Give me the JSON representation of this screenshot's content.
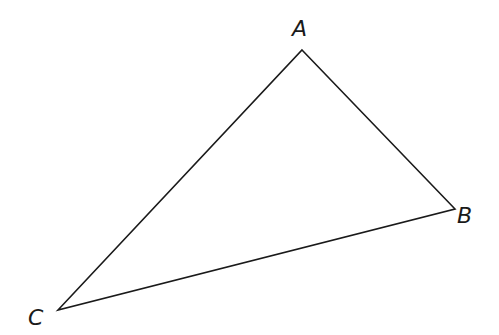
{
  "diagram": {
    "type": "triangle",
    "stroke_color": "#1a1a1a",
    "vertices": [
      {
        "label": "A",
        "x": 302,
        "y": 50
      },
      {
        "label": "B",
        "x": 455,
        "y": 209
      },
      {
        "label": "C",
        "x": 58,
        "y": 310
      }
    ]
  }
}
